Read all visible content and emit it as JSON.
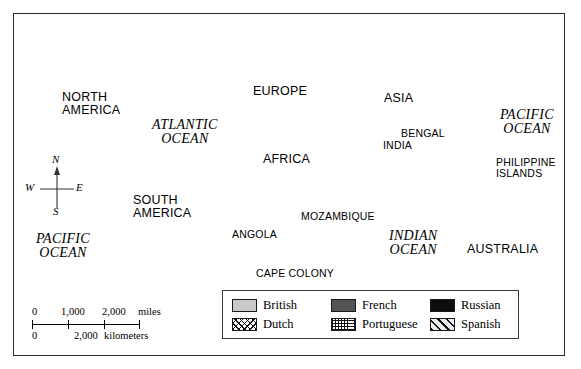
{
  "figure": {
    "kind": "historical-world-map",
    "frame_color": "#2b2b2b",
    "background": "#ffffff"
  },
  "map_labels": {
    "continents": [
      {
        "id": "north-america",
        "text": "NORTH\nAMERICA",
        "x": 62,
        "y": 91,
        "size": 12.5
      },
      {
        "id": "south-america",
        "text": "SOUTH\nAMERICA",
        "x": 133,
        "y": 194,
        "size": 12.5
      },
      {
        "id": "europe",
        "text": "EUROPE",
        "x": 253,
        "y": 85,
        "size": 12.5
      },
      {
        "id": "asia",
        "text": "ASIA",
        "x": 384,
        "y": 92,
        "size": 12.5
      },
      {
        "id": "africa",
        "text": "AFRICA",
        "x": 263,
        "y": 153,
        "size": 12.5
      },
      {
        "id": "australia",
        "text": "AUSTRALIA",
        "x": 467,
        "y": 243,
        "size": 12.5
      }
    ],
    "regions": [
      {
        "id": "india",
        "text": "INDIA",
        "x": 383,
        "y": 140,
        "size": 10.5
      },
      {
        "id": "bengal",
        "text": "BENGAL",
        "x": 401,
        "y": 128,
        "size": 10.5
      },
      {
        "id": "angola",
        "text": "ANGOLA",
        "x": 232,
        "y": 229,
        "size": 10.5
      },
      {
        "id": "mozambique",
        "text": "MOZAMBIQUE",
        "x": 301,
        "y": 211,
        "size": 10.5
      },
      {
        "id": "cape-colony",
        "text": "CAPE COLONY",
        "x": 256,
        "y": 268,
        "size": 10.5
      },
      {
        "id": "philippine-islands",
        "text": "PHILIPPINE\nISLANDS",
        "x": 496,
        "y": 157,
        "size": 10.5
      }
    ],
    "oceans": [
      {
        "id": "atlantic-ocean",
        "text": "ATLANTIC\nOCEAN",
        "x": 152,
        "y": 118,
        "size": 14
      },
      {
        "id": "pacific-ocean-west",
        "text": "PACIFIC\nOCEAN",
        "x": 36,
        "y": 232,
        "size": 14
      },
      {
        "id": "pacific-ocean-east",
        "text": "PACIFIC\nOCEAN",
        "x": 500,
        "y": 108,
        "size": 14
      },
      {
        "id": "indian-ocean",
        "text": "INDIAN\nOCEAN",
        "x": 389,
        "y": 229,
        "size": 14
      }
    ]
  },
  "compass": {
    "north": "N",
    "west": "W",
    "east": "E",
    "south": "S"
  },
  "scale_bar": {
    "miles": {
      "labels": [
        "0",
        "1,000",
        "2,000"
      ],
      "unit": "miles",
      "caption": "0    1,000  2,000 miles"
    },
    "kilometers": {
      "labels": [
        "0",
        "2,000"
      ],
      "unit": "kilometers",
      "caption": "0          2,000 kilometers"
    }
  },
  "legend": {
    "items": [
      {
        "id": "british",
        "label": "British",
        "pattern": "solid-light-gray",
        "color": "#c9c9c9"
      },
      {
        "id": "french",
        "label": "French",
        "pattern": "solid-dark-gray",
        "color": "#545454"
      },
      {
        "id": "russian",
        "label": "Russian",
        "pattern": "solid-black",
        "color": "#0d0d0d"
      },
      {
        "id": "dutch",
        "label": "Dutch",
        "pattern": "crosshatch",
        "color": "#111111"
      },
      {
        "id": "portuguese",
        "label": "Portuguese",
        "pattern": "dotted-grid",
        "color": "#111111"
      },
      {
        "id": "spanish",
        "label": "Spanish",
        "pattern": "diagonal-stripes",
        "color": "#111111"
      }
    ]
  }
}
